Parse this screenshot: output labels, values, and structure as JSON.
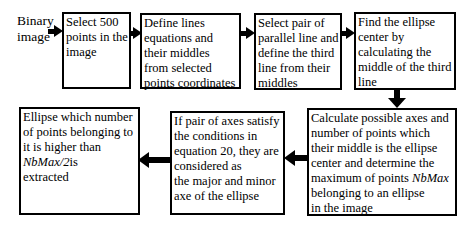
{
  "colors": {
    "ink": "#000000",
    "background": "#ffffff"
  },
  "flowchart": {
    "start_label": "Binary image",
    "boxes": [
      {
        "name": "select-points",
        "lines": [
          [
            {
              "t": "Select 500"
            }
          ],
          [
            {
              "t": "points in the"
            }
          ],
          [
            {
              "t": "image"
            }
          ]
        ]
      },
      {
        "name": "define-lines",
        "lines": [
          [
            {
              "t": "Define lines"
            }
          ],
          [
            {
              "t": "equations and"
            }
          ],
          [
            {
              "t": "their middles"
            }
          ],
          [
            {
              "t": "from selected"
            }
          ],
          [
            {
              "t": "points coordinates"
            }
          ]
        ]
      },
      {
        "name": "select-parallel-pair",
        "lines": [
          [
            {
              "t": "Select pair of"
            }
          ],
          [
            {
              "t": "parallel line and"
            }
          ],
          [
            {
              "t": "define the third"
            }
          ],
          [
            {
              "t": "line from their"
            }
          ],
          [
            {
              "t": "middles"
            }
          ]
        ]
      },
      {
        "name": "find-ellipse-center",
        "lines": [
          [
            {
              "t": "Find the ellipse"
            }
          ],
          [
            {
              "t": "center by"
            }
          ],
          [
            {
              "t": "calculating the"
            }
          ],
          [
            {
              "t": "middle of the third"
            }
          ],
          [
            {
              "t": "line"
            }
          ]
        ]
      },
      {
        "name": "calculate-axes",
        "lines": [
          [
            {
              "t": "Calculate possible axes and"
            }
          ],
          [
            {
              "t": "number of points which"
            }
          ],
          [
            {
              "t": "their middle is the ellipse"
            }
          ],
          [
            {
              "t": "center and determine the"
            }
          ],
          [
            {
              "t": "maximum of points "
            },
            {
              "t": "NbMax",
              "i": true
            }
          ],
          [
            {
              "t": "belonging to an ellipse"
            }
          ],
          [
            {
              "t": "in the image"
            }
          ]
        ]
      },
      {
        "name": "axes-condition",
        "lines": [
          [
            {
              "t": "If pair of axes satisfy"
            }
          ],
          [
            {
              "t": "the conditions in"
            }
          ],
          [
            {
              "t": "equation 20, they are"
            }
          ],
          [
            {
              "t": "considered as"
            }
          ],
          [
            {
              "t": "the major and minor"
            }
          ],
          [
            {
              "t": "axe of the ellipse"
            }
          ]
        ]
      },
      {
        "name": "ellipse-extracted",
        "lines": [
          [
            {
              "t": "Ellipse which number"
            }
          ],
          [
            {
              "t": "of points belonging to"
            }
          ],
          [
            {
              "t": "it is higher than"
            }
          ],
          [
            {
              "t": "NbMax/2",
              "i": true
            },
            {
              "t": "is"
            }
          ],
          [
            {
              "t": "extracted"
            }
          ]
        ]
      }
    ]
  }
}
